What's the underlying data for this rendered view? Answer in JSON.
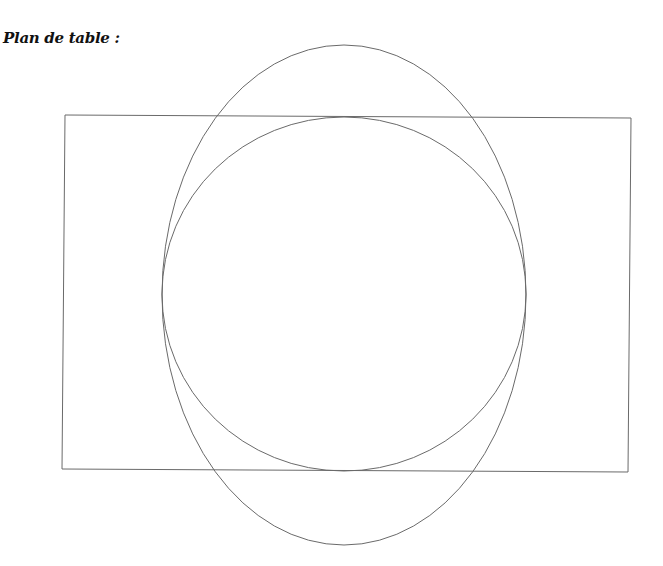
{
  "title": "Plan de table :",
  "diagram": {
    "stroke_color": "#6a6a6a",
    "stroke_width": 1,
    "shapes": [
      {
        "name": "table-rectangle",
        "type": "polygon",
        "points": [
          [
            65,
            115
          ],
          [
            631,
            118
          ],
          [
            628,
            472
          ],
          [
            62,
            469
          ]
        ]
      },
      {
        "name": "round-table-circle",
        "type": "ellipse",
        "cx": 344,
        "cy": 294,
        "rx": 182,
        "ry": 177
      },
      {
        "name": "oval-table-ellipse",
        "type": "ellipse",
        "cx": 344,
        "cy": 295,
        "rx": 182,
        "ry": 250
      }
    ]
  }
}
